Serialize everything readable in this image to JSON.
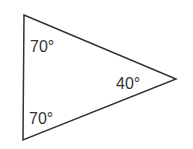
{
  "diagram": {
    "shape": "triangle",
    "stroke_color": "#333333",
    "angles": [
      {
        "vertex": "top-left",
        "label": "70°"
      },
      {
        "vertex": "right",
        "label": "40°"
      },
      {
        "vertex": "bottom-left",
        "label": "70°"
      }
    ]
  }
}
